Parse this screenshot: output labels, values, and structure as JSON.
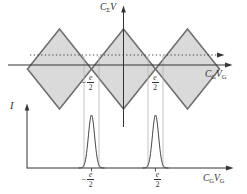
{
  "figure": {
    "background": "#ffffff",
    "diamond_fill": "#dadada",
    "diamond_stroke": "#6f6f6f",
    "line_color": "#333333",
    "guide_color": "#b5b5b5"
  },
  "top_plot": {
    "y_label": {
      "c": "C",
      "sub": "Σ",
      "v": "V"
    },
    "x_label": {
      "c": "C",
      "csub": "G",
      "v": "V",
      "vsub": "G"
    },
    "tick_neg": {
      "sign": "−",
      "num": "e",
      "den": "2"
    },
    "tick_pos": {
      "num": "e",
      "den": "2"
    }
  },
  "bottom_plot": {
    "y_label": "I",
    "x_label": {
      "c": "C",
      "csub": "G",
      "v": "V",
      "vsub": "G"
    },
    "tick_neg": {
      "sign": "−",
      "num": "e",
      "den": "2"
    },
    "tick_pos": {
      "num": "e",
      "den": "2"
    }
  },
  "chart_data": {
    "type": "line",
    "top": {
      "x_tick_labels": [
        "-e/2",
        "e/2"
      ],
      "diamond_count": 3,
      "diamond_centers_px": [
        59.5,
        123.5,
        187.5
      ],
      "diamond_half_width_px": 32,
      "diamond_half_height_px": 40,
      "center_line_y_px": 69,
      "solid_axis_y_px": 65,
      "dotted_line_y_px": 55
    },
    "bottom": {
      "x_tick_labels": [
        "-e/2",
        "e/2"
      ],
      "peak_centers_px": [
        91.5,
        155.5
      ],
      "peak_height_px": 53,
      "peak_sigma_px": 3.1,
      "baseline_y_px": 168
    },
    "guide_lines_x_px": [
      84,
      99,
      148,
      163
    ]
  }
}
